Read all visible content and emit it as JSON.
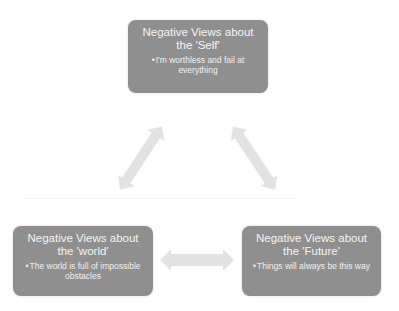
{
  "diagram": {
    "type": "cognitive-triad",
    "colors": {
      "node_fill": "#8f8f8f",
      "node_text": "#f2f2f2",
      "arrow_fill": "#e2e2e2",
      "background": "#ffffff"
    },
    "nodes": [
      {
        "id": "self",
        "title": "Negative Views about the 'Self'",
        "bullet": "I'm worthless and fail at everything"
      },
      {
        "id": "world",
        "title": "Negative Views about the 'world'",
        "bullet": "The world is full of impossible obstacles"
      },
      {
        "id": "future",
        "title": "Negative Views about the 'Future'",
        "bullet": "Things will always be this way"
      }
    ],
    "connections": [
      {
        "from": "self",
        "to": "world",
        "type": "bidirectional-arrow"
      },
      {
        "from": "self",
        "to": "future",
        "type": "bidirectional-arrow"
      },
      {
        "from": "world",
        "to": "future",
        "type": "bidirectional-arrow"
      }
    ],
    "bullet_glyph": "•"
  }
}
